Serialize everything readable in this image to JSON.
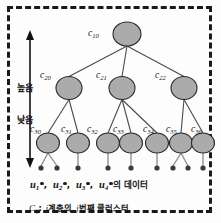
{
  "figure": {
    "type": "hierarchical-cluster-tree",
    "border_style": "dashed",
    "border_color": "#1a1a1a",
    "node_fill": "#ababab",
    "node_stroke": "#2a2a2a"
  },
  "axis": {
    "top_label": "높음",
    "bottom_label": "낮음",
    "orientation": "vertical-double-arrow"
  },
  "tree": {
    "levels": [
      {
        "level": 1,
        "nodes": [
          {
            "id": "c10",
            "base": "c",
            "sub": "10",
            "cx": 127,
            "cy": 34,
            "rx": 14,
            "ry": 12,
            "label_x": 88,
            "label_y": 28
          }
        ]
      },
      {
        "level": 2,
        "nodes": [
          {
            "id": "c20",
            "base": "c",
            "sub": "20",
            "cx": 69,
            "cy": 88,
            "rx": 13,
            "ry": 11.5,
            "label_x": 40,
            "label_y": 70
          },
          {
            "id": "c21",
            "base": "c",
            "sub": "21",
            "cx": 122,
            "cy": 88,
            "rx": 13,
            "ry": 11.5,
            "label_x": 96,
            "label_y": 70
          },
          {
            "id": "c22",
            "base": "c",
            "sub": "22",
            "cx": 184,
            "cy": 88,
            "rx": 13,
            "ry": 11.5,
            "label_x": 155,
            "label_y": 70
          }
        ]
      },
      {
        "level": 3,
        "nodes": [
          {
            "id": "c30",
            "base": "c",
            "sub": "30",
            "cx": 48,
            "cy": 143,
            "rx": 11.5,
            "ry": 10,
            "label_x": 30,
            "label_y": 124
          },
          {
            "id": "c31",
            "base": "c",
            "sub": "31",
            "cx": 78,
            "cy": 143,
            "rx": 11.5,
            "ry": 10,
            "label_x": 61,
            "label_y": 124
          },
          {
            "id": "c32",
            "base": "c",
            "sub": "32",
            "cx": 108,
            "cy": 143,
            "rx": 11.5,
            "ry": 10,
            "label_x": 87,
            "label_y": 124
          },
          {
            "id": "c33",
            "base": "c",
            "sub": "33",
            "cx": 131,
            "cy": 143,
            "rx": 11.5,
            "ry": 10,
            "label_x": 113,
            "label_y": 124
          },
          {
            "id": "c34",
            "base": "c",
            "sub": "34",
            "cx": 157,
            "cy": 143,
            "rx": 11.5,
            "ry": 10,
            "label_x": 143,
            "label_y": 124
          },
          {
            "id": "c35",
            "base": "c",
            "sub": "35",
            "cx": 181,
            "cy": 143,
            "rx": 11.5,
            "ry": 10,
            "label_x": 166,
            "label_y": 124
          },
          {
            "id": "c36",
            "base": "c",
            "sub": "36",
            "cx": 203,
            "cy": 143,
            "rx": 11.5,
            "ry": 10,
            "label_x": 191,
            "label_y": 124
          }
        ]
      }
    ],
    "edges": [
      {
        "from": "c10",
        "to": "c20"
      },
      {
        "from": "c10",
        "to": "c21"
      },
      {
        "from": "c10",
        "to": "c22"
      },
      {
        "from": "c20",
        "to": "c30"
      },
      {
        "from": "c20",
        "to": "c31"
      },
      {
        "from": "c21",
        "to": "c32"
      },
      {
        "from": "c21",
        "to": "c33"
      },
      {
        "from": "c21",
        "to": "c34"
      },
      {
        "from": "c22",
        "to": "c35"
      },
      {
        "from": "c22",
        "to": "c36"
      }
    ],
    "data_points": [
      {
        "parent": "c30",
        "x": 41,
        "y": 168
      },
      {
        "parent": "c30",
        "x": 57,
        "y": 168
      },
      {
        "parent": "c31",
        "x": 78,
        "y": 168
      },
      {
        "parent": "c32",
        "x": 108,
        "y": 168
      },
      {
        "parent": "c33",
        "x": 131,
        "y": 168
      },
      {
        "parent": "c34",
        "x": 157,
        "y": 168
      },
      {
        "parent": "c35",
        "x": 173,
        "y": 168
      },
      {
        "parent": "c35",
        "x": 188,
        "y": 168
      },
      {
        "parent": "c36",
        "x": 203,
        "y": 168
      }
    ]
  },
  "legend": {
    "users": [
      {
        "base": "u",
        "sub": "1"
      },
      {
        "base": "u",
        "sub": "2"
      },
      {
        "base": "u",
        "sub": "3"
      },
      {
        "base": "u",
        "sub": "4"
      }
    ],
    "separator": ",",
    "suffix": "의 데이터"
  },
  "caption": {
    "symbol_base": "C",
    "symbol_sub": "ij",
    "colon": ":",
    "text_i": "i",
    "text_mid": "계층의",
    "text_j": "j",
    "text_end": "번째 클러스터"
  }
}
